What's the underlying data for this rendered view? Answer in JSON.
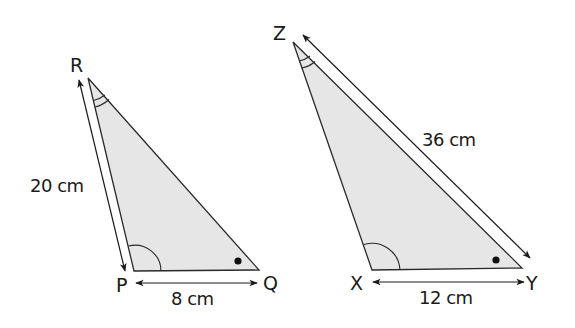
{
  "diagram": {
    "type": "similar-triangles",
    "colors": {
      "fill": "#e6e6e6",
      "stroke": "#2a2a2a",
      "text": "#1a1a1a",
      "background": "#ffffff"
    },
    "triangles": [
      {
        "name": "PQR",
        "vertices": {
          "R": {
            "label": "R",
            "x": 88,
            "y": 78
          },
          "P": {
            "label": "P",
            "x": 134,
            "y": 271
          },
          "Q": {
            "label": "Q",
            "x": 259,
            "y": 270
          }
        },
        "sides": [
          {
            "between": "RP",
            "label": "20 cm"
          },
          {
            "between": "PQ",
            "label": "8 cm"
          }
        ],
        "angle_marks": [
          {
            "at": "R",
            "type": "double-arc"
          },
          {
            "at": "P",
            "type": "single-arc"
          },
          {
            "at": "Q",
            "type": "dot"
          }
        ]
      },
      {
        "name": "XYZ",
        "vertices": {
          "Z": {
            "label": "Z",
            "x": 293,
            "y": 42
          },
          "X": {
            "label": "X",
            "x": 372,
            "y": 270
          },
          "Y": {
            "label": "Y",
            "x": 522,
            "y": 268
          }
        },
        "sides": [
          {
            "between": "ZY",
            "label": "36 cm"
          },
          {
            "between": "XY",
            "label": "12 cm"
          }
        ],
        "angle_marks": [
          {
            "at": "Z",
            "type": "double-arc"
          },
          {
            "at": "X",
            "type": "single-arc"
          },
          {
            "at": "Y",
            "type": "dot"
          }
        ]
      }
    ],
    "labels": {
      "R": "R",
      "P": "P",
      "Q": "Q",
      "Z": "Z",
      "X": "X",
      "Y": "Y",
      "rp_length": "20 cm",
      "pq_length": "8 cm",
      "zy_length": "36 cm",
      "xy_length": "12 cm"
    }
  }
}
